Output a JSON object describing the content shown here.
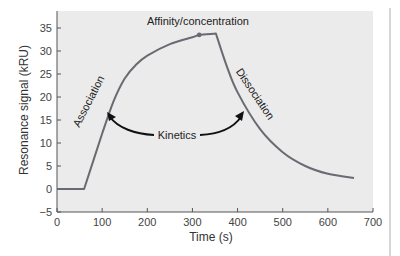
{
  "chart_data": {
    "type": "line",
    "title": "",
    "xlabel": "Time (s)",
    "ylabel": "Resonance signal (kRU)",
    "xlim": [
      0,
      700
    ],
    "ylim": [
      -5,
      38
    ],
    "x_ticks": [
      0,
      100,
      200,
      300,
      400,
      500,
      600,
      700
    ],
    "y_ticks": [
      -5,
      0,
      5,
      10,
      15,
      20,
      25,
      30,
      35
    ],
    "grid": false,
    "series": [
      {
        "name": "SPR sensorgram",
        "color": "#6a6a72",
        "x": [
          0,
          60,
          80,
          100,
          125,
          150,
          175,
          200,
          250,
          300,
          315,
          352,
          375,
          400,
          450,
          500,
          550,
          600,
          658
        ],
        "y": [
          0,
          0,
          6,
          12,
          19,
          24,
          27,
          29,
          31.5,
          33,
          33.5,
          33.8,
          27,
          21,
          13,
          8,
          5,
          3.3,
          2.4
        ]
      }
    ],
    "annotations": [
      {
        "text": "Affinity/concentration",
        "x": 315,
        "y": 33.5,
        "marker": "dot"
      },
      {
        "text": "Association",
        "x": 100,
        "y": 15,
        "rotation": -62
      },
      {
        "text": "Dissociation",
        "x": 440,
        "y": 20,
        "rotation": 55
      },
      {
        "text": "Kinetics",
        "x": 265,
        "y": 12,
        "arrows_to": [
          "Association",
          "Dissociation"
        ]
      }
    ],
    "background": "#ebebeb"
  },
  "labels": {
    "x_axis_title": "Time (s)",
    "y_axis_title": "Resonance signal (kRU)",
    "affinity": "Affinity/concentration",
    "association": "Association",
    "dissociation": "Dissociation",
    "kinetics": "Kinetics",
    "x_ticks": [
      "0",
      "100",
      "200",
      "300",
      "400",
      "500",
      "600",
      "700"
    ],
    "y_ticks": [
      "−5",
      "0",
      "5",
      "10",
      "15",
      "20",
      "25",
      "30",
      "35"
    ]
  }
}
